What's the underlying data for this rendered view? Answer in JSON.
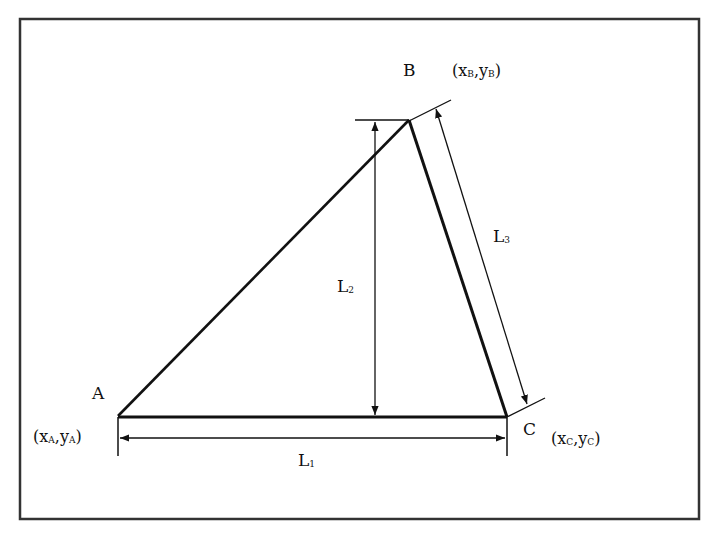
{
  "diagram": {
    "type": "triangle-dimension-drawing",
    "colors": {
      "line": "#111111",
      "frame": "#333333",
      "background": "#ffffff"
    },
    "points": [
      {
        "id": "A",
        "label": "A",
        "coord": {
          "x": "x",
          "x_sub": "A",
          "y": "y",
          "y_sub": "A"
        }
      },
      {
        "id": "B",
        "label": "B",
        "coord": {
          "x": "x",
          "x_sub": "B",
          "y": "y",
          "y_sub": "B"
        }
      },
      {
        "id": "C",
        "label": "C",
        "coord": {
          "x": "x",
          "x_sub": "C",
          "y": "y",
          "y_sub": "C"
        }
      }
    ],
    "dimensions": [
      {
        "id": "L1",
        "base": "L",
        "sub": "1",
        "between": "A-C (base)"
      },
      {
        "id": "L2",
        "base": "L",
        "sub": "2",
        "between": "B height to base"
      },
      {
        "id": "L3",
        "base": "L",
        "sub": "3",
        "between": "B-C side"
      }
    ],
    "punctuation": {
      "open": "(",
      "comma": ",",
      "close": ")"
    }
  }
}
